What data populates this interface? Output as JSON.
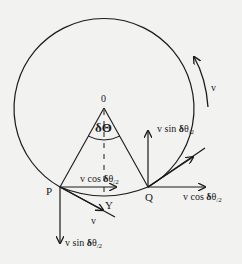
{
  "diagram": {
    "type": "circular-motion-velocity-components",
    "background": "#f2f2f0",
    "stroke_color": "#1a1a1a",
    "circle": {
      "cx": 107,
      "cy": 108,
      "r": 90
    },
    "center_label": "0",
    "angle_label": "δΘ",
    "points": {
      "P": {
        "label": "P",
        "x": 60,
        "y": 187
      },
      "Q": {
        "label": "Q",
        "x": 148,
        "y": 187
      },
      "Y": {
        "label": "Y"
      }
    },
    "labels": {
      "v_direction": "v",
      "v_at_P": "v",
      "p_horizontal": "v cos δθ/2",
      "p_vertical": "v sin δθ/2",
      "q_horizontal": "v cos δθ/2",
      "q_vertical": "v sin δθ/2"
    },
    "label_parts": {
      "v_cos": "v cos ",
      "v_sin": "v sin ",
      "delta": "δ",
      "theta": "θ",
      "half": "/2"
    }
  }
}
